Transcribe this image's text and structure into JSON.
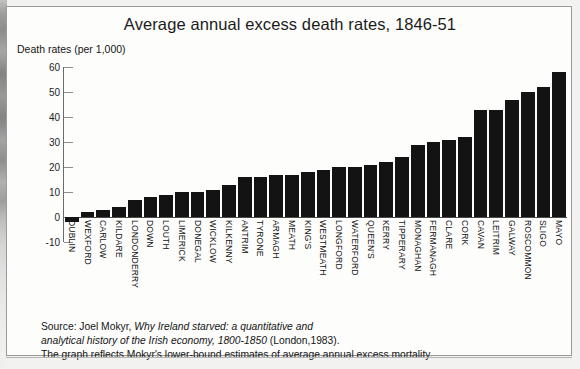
{
  "chart_data": {
    "type": "bar",
    "title": "Average annual excess death rates, 1846-51",
    "ylabel": "Death rates (per 1,000)",
    "xlabel": "",
    "ylim": [
      -10,
      60
    ],
    "yticks": [
      60,
      50,
      40,
      30,
      20,
      10,
      0,
      -10
    ],
    "grid": false,
    "legend": null,
    "bar_color": "#131313",
    "categories": [
      "DUBLIN",
      "WEXFORD",
      "CARLOW",
      "KILDARE",
      "LONDONDERRY",
      "DOWN",
      "LOUTH",
      "LIMERICK",
      "DONEGAL",
      "WICKLOW",
      "KILKENNY",
      "ANTRIM",
      "TYRONE",
      "ARMAGH",
      "MEATH",
      "KING'S",
      "WESTMEATH",
      "LONGFORD",
      "WATERFORD",
      "QUEEN'S",
      "KERRY",
      "TIPPERARY",
      "MONAGHAN",
      "FERMANAGH",
      "CLARE",
      "CORK",
      "CAVAN",
      "LEITRIM",
      "GALWAY",
      "ROSCOMMON",
      "SLIGO",
      "MAYO"
    ],
    "values": [
      -2,
      2,
      3,
      4,
      7,
      8,
      9,
      10,
      10,
      11,
      13,
      16,
      16,
      17,
      17,
      18,
      19,
      20,
      20,
      21,
      22,
      24,
      29,
      30,
      31,
      32,
      43,
      43,
      47,
      50,
      52,
      58
    ]
  },
  "source": {
    "line1_prefix": "Source: Joel Mokyr, ",
    "line1_italic": "Why Ireland starved: a quantitative and",
    "line2_italic": "analytical history of the Irish economy, 1800-1850",
    "line2_suffix": " (London,1983).",
    "line3": "The graph reflects Mokyr's lower-bound estimates of average annual excess mortality."
  }
}
